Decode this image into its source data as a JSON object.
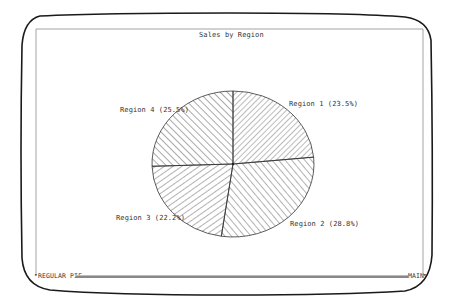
{
  "chart_data": {
    "type": "pie",
    "title": "Sales by Region",
    "categories": [
      "Region 1",
      "Region 2",
      "Region 3",
      "Region 4"
    ],
    "values": [
      23.5,
      28.8,
      22.2,
      25.5
    ],
    "labels": [
      "Region 1 (23.5%)",
      "Region 2 (28.8%)",
      "Region 3 (22.2%)",
      "Region 4 (25.5%)"
    ],
    "fill": "hatched",
    "start_angle_deg": 0,
    "direction": "clockwise",
    "legend": "none (labels beside slices)"
  },
  "status_bar": {
    "left_label": "REGULAR PIE",
    "right_label": "MAIN"
  },
  "colors": {
    "background": "#ffffff",
    "ink": "#333333",
    "bezel": "#1a1a1a",
    "frame": "#999999"
  }
}
